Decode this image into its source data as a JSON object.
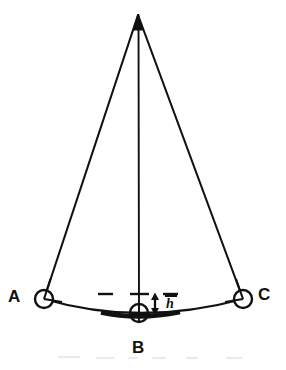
{
  "figure": {
    "kind": "line-diagram",
    "background_color": "#ffffff",
    "stroke_color": "#111111",
    "labels": {
      "node_left": "A",
      "node_bottom": "B",
      "node_right": "C",
      "sag_height": "h"
    },
    "icons": {
      "node_left": "circle-node-icon",
      "node_bottom": "circle-node-icon",
      "node_right": "circle-node-icon",
      "sag_arrow": "double-headed-arrow-icon",
      "apex": "apex-vertex-icon"
    },
    "geometry": {
      "apex": {
        "x": 138,
        "y": 15
      },
      "node_left": {
        "x": 44,
        "y": 299,
        "r": 9
      },
      "node_bottom": {
        "x": 139,
        "y": 313,
        "r": 9
      },
      "node_right": {
        "x": 243,
        "y": 299,
        "r": 9
      },
      "chord_left_right": {
        "x1": 44,
        "y1": 299,
        "x2": 243,
        "y2": 299
      },
      "arc_sag_px": 14,
      "arrow": {
        "x": 155,
        "y_top": 294,
        "y_bottom": 313
      },
      "tick_left": {
        "x1": 98,
        "x2": 113,
        "y": 294
      },
      "tick_center": {
        "x1": 130,
        "x2": 149,
        "y": 294
      },
      "tick_right": {
        "x1": 163,
        "x2": 178,
        "y": 294
      },
      "bold_segment": {
        "x1": 100,
        "x2": 180,
        "y": 313
      }
    }
  },
  "scan_artifacts": [
    {
      "x": 58,
      "y": 356,
      "w": 22
    },
    {
      "x": 96,
      "y": 357,
      "w": 18
    },
    {
      "x": 128,
      "y": 357,
      "w": 10
    },
    {
      "x": 152,
      "y": 357,
      "w": 14
    },
    {
      "x": 186,
      "y": 357,
      "w": 12
    },
    {
      "x": 226,
      "y": 357,
      "w": 16
    }
  ]
}
